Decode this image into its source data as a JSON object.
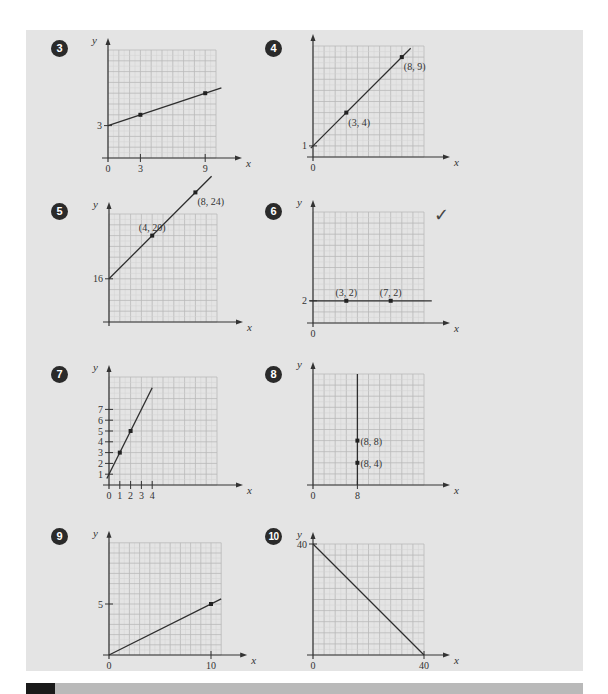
{
  "page": {
    "background": "#ffffff",
    "panel_color": "#e4e4e4",
    "grid_major_color": "#b9b9b9",
    "grid_minor_color": "#d2d2d2",
    "line_color": "#2e2e2e",
    "badge_color": "#2a2a2a"
  },
  "checkmark": {
    "icon": "check-mark-icon",
    "glyph": "✓",
    "exercise": "6"
  },
  "chart_data": [
    {
      "id": "g3",
      "exercise": "3",
      "type": "line",
      "xlabel": "x",
      "ylabel": "y",
      "x_ticks": [
        {
          "v": 0,
          "label": "0"
        },
        {
          "v": 3,
          "label": "3"
        },
        {
          "v": 9,
          "label": "9"
        }
      ],
      "y_ticks": [
        {
          "v": 3,
          "label": "3"
        }
      ],
      "points": [
        {
          "x": 3,
          "y": 4
        },
        {
          "x": 9,
          "y": 6
        }
      ],
      "point_labels": [],
      "line": {
        "x0": 0,
        "y0": 3,
        "x1": 10.5,
        "y1": 6.5
      },
      "grid": {
        "cols": 10,
        "rows": 10
      },
      "ylim": [
        0,
        10
      ],
      "xlim": [
        0,
        10
      ]
    },
    {
      "id": "g4",
      "exercise": "4",
      "type": "line",
      "xlabel": "x",
      "ylabel": "",
      "x_ticks": [
        {
          "v": 0,
          "label": "0"
        }
      ],
      "y_ticks": [
        {
          "v": 1,
          "label": "1"
        }
      ],
      "points": [
        {
          "x": 3,
          "y": 4
        },
        {
          "x": 8,
          "y": 9
        }
      ],
      "point_labels": [
        {
          "x": 3,
          "y": 4,
          "label": "(3, 4)"
        },
        {
          "x": 8,
          "y": 9,
          "label": "(8, 9)"
        }
      ],
      "line": {
        "x0": -0.2,
        "y0": 0.8,
        "x1": 8.8,
        "y1": 9.8
      },
      "grid": {
        "cols": 10,
        "rows": 10
      },
      "ylim": [
        0,
        10
      ],
      "xlim": [
        0,
        10
      ]
    },
    {
      "id": "g5",
      "exercise": "5",
      "type": "line",
      "xlabel": "x",
      "ylabel": "y",
      "x_ticks": [],
      "y_ticks": [
        {
          "v": 16,
          "label": "16"
        }
      ],
      "points": [
        {
          "x": 4,
          "y": 20
        },
        {
          "x": 8,
          "y": 24
        }
      ],
      "point_labels": [
        {
          "x": 4,
          "y": 20,
          "label": "(4, 20)"
        },
        {
          "x": 8,
          "y": 24,
          "label": "(8, 24)"
        }
      ],
      "line": {
        "x0": 0,
        "y0": 16,
        "x1": 9.5,
        "y1": 25.5
      },
      "grid": {
        "cols": 10,
        "rows": 10
      },
      "note": "y axis broken/offset, 16 at ~4 grid rows above origin",
      "ylim": [
        12,
        32
      ],
      "xlim": [
        0,
        10
      ]
    },
    {
      "id": "g6",
      "exercise": "6",
      "type": "line",
      "xlabel": "x",
      "ylabel": "y",
      "x_ticks": [
        {
          "v": 0,
          "label": "0"
        }
      ],
      "y_ticks": [
        {
          "v": 2,
          "label": "2"
        }
      ],
      "points": [
        {
          "x": 3,
          "y": 2
        },
        {
          "x": 7,
          "y": 2
        }
      ],
      "point_labels": [
        {
          "x": 3,
          "y": 2,
          "label": "(3, 2)"
        },
        {
          "x": 7,
          "y": 2,
          "label": "(7, 2)"
        }
      ],
      "line": {
        "x0": -0.3,
        "y0": 2,
        "x1": 10.7,
        "y1": 2
      },
      "grid": {
        "cols": 10,
        "rows": 10
      },
      "ylim": [
        0,
        10
      ],
      "xlim": [
        0,
        10
      ]
    },
    {
      "id": "g7",
      "exercise": "7",
      "type": "line",
      "xlabel": "x",
      "ylabel": "y",
      "x_ticks": [
        {
          "v": 0,
          "label": "0"
        },
        {
          "v": 1,
          "label": "1"
        },
        {
          "v": 2,
          "label": "2"
        },
        {
          "v": 3,
          "label": "3"
        },
        {
          "v": 4,
          "label": "4"
        }
      ],
      "y_ticks": [
        {
          "v": 1,
          "label": "1"
        },
        {
          "v": 2,
          "label": "2"
        },
        {
          "v": 3,
          "label": "3"
        },
        {
          "v": 4,
          "label": "4"
        },
        {
          "v": 5,
          "label": "5"
        },
        {
          "v": 6,
          "label": "6"
        },
        {
          "v": 7,
          "label": "7"
        }
      ],
      "points": [
        {
          "x": 1,
          "y": 3
        },
        {
          "x": 2,
          "y": 5
        }
      ],
      "point_labels": [],
      "line": {
        "x0": -0.2,
        "y0": 0.6,
        "x1": 4,
        "y1": 9
      },
      "grid": {
        "cols": 10,
        "rows": 10
      },
      "ylim": [
        0,
        10
      ],
      "xlim": [
        0,
        10
      ]
    },
    {
      "id": "g8",
      "exercise": "8",
      "type": "line",
      "xlabel": "x",
      "ylabel": "y",
      "x_ticks": [
        {
          "v": 0,
          "label": "0"
        },
        {
          "v": 8,
          "label": "8"
        }
      ],
      "y_ticks": [],
      "points": [
        {
          "x": 8,
          "y": 8
        },
        {
          "x": 8,
          "y": 4
        }
      ],
      "point_labels": [
        {
          "x": 8,
          "y": 8,
          "label": "(8, 8)"
        },
        {
          "x": 8,
          "y": 4,
          "label": "(8, 4)"
        }
      ],
      "line": {
        "x0": 8,
        "y0": 0,
        "x1": 8,
        "y1": 20
      },
      "grid": {
        "cols": 10,
        "rows": 10
      },
      "x_units_per_cell": 2,
      "y_units_per_cell": 2,
      "ylim": [
        0,
        20
      ],
      "xlim": [
        0,
        20
      ]
    },
    {
      "id": "g9",
      "exercise": "9",
      "type": "line",
      "xlabel": "x",
      "ylabel": "y",
      "x_ticks": [
        {
          "v": 0,
          "label": "0"
        },
        {
          "v": 10,
          "label": "10"
        }
      ],
      "y_ticks": [
        {
          "v": 5,
          "label": "5"
        }
      ],
      "points": [
        {
          "x": 10,
          "y": 5
        }
      ],
      "point_labels": [],
      "line": {
        "x0": 0,
        "y0": 0,
        "x1": 11,
        "y1": 5.5
      },
      "grid": {
        "cols": 11,
        "rows": 11
      },
      "ylim": [
        0,
        11
      ],
      "xlim": [
        0,
        11
      ]
    },
    {
      "id": "g10",
      "exercise": "10",
      "type": "line",
      "xlabel": "x",
      "ylabel": "y",
      "x_ticks": [
        {
          "v": 0,
          "label": "0"
        },
        {
          "v": 40,
          "label": "40"
        }
      ],
      "y_ticks": [
        {
          "v": 40,
          "label": "40"
        }
      ],
      "points": [],
      "point_labels": [],
      "line": {
        "x0": 0,
        "y0": 40,
        "x1": 40,
        "y1": 0
      },
      "grid": {
        "cols": 10,
        "rows": 10
      },
      "x_units_per_cell": 4,
      "y_units_per_cell": 4,
      "ylim": [
        0,
        40
      ],
      "xlim": [
        0,
        40
      ]
    }
  ]
}
